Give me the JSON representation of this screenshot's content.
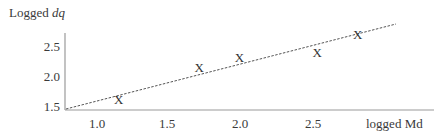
{
  "chart_data": {
    "type": "scatter",
    "title": "",
    "ylabel_prefix": "Logged ",
    "ylabel_var": "dq",
    "xlabel": "logged Md",
    "x_ticks": [
      "1.0",
      "1.5",
      "2.0",
      "2.5"
    ],
    "y_ticks": [
      "2.5",
      "2.0",
      "1.5"
    ],
    "xlim": [
      0.78,
      3.1
    ],
    "ylim": [
      1.47,
      2.9
    ],
    "grid": false,
    "legend": null,
    "marker": "X",
    "points": [
      {
        "x": 1.15,
        "y": 1.65
      },
      {
        "x": 1.71,
        "y": 2.18
      },
      {
        "x": 1.99,
        "y": 2.35
      },
      {
        "x": 2.53,
        "y": 2.43
      },
      {
        "x": 2.81,
        "y": 2.73
      }
    ],
    "trend_line": {
      "style": "dashed",
      "x": [
        0.78,
        3.08
      ],
      "y": [
        1.47,
        2.9
      ]
    }
  },
  "labels": {
    "y_title_prefix": "Logged ",
    "y_title_var": "dq",
    "x_title": "logged Md",
    "y_tick_0": "2.5",
    "y_tick_1": "2.0",
    "y_tick_2": "1.5",
    "x_tick_0": "1.0",
    "x_tick_1": "1.5",
    "x_tick_2": "2.0",
    "x_tick_3": "2.5",
    "marker": "X"
  }
}
